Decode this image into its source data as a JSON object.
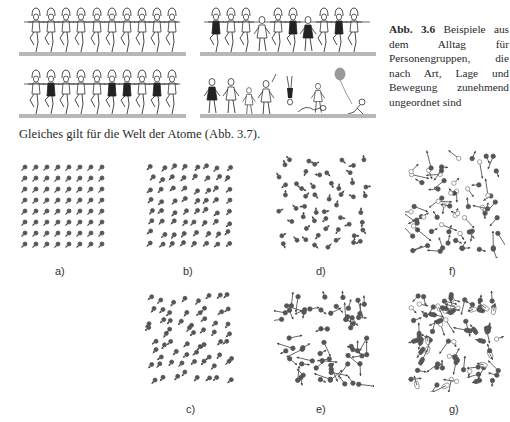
{
  "figure_3_6": {
    "caption_label": "Abb. 3.6",
    "caption_text": "Beispiele aus dem Alltag für Personengruppen, die nach Art, Lage und Bewegung zunehmend ungeordnet sind",
    "rows": [
      {
        "name": "top-left",
        "description": "10 identical dancers in a kick line"
      },
      {
        "name": "top-right",
        "description": "dancers in a kick line with some out of step"
      },
      {
        "name": "bottom-left",
        "description": "10 dancers in a kick line, some in dark dresses"
      },
      {
        "name": "bottom-right",
        "description": "people walking, jumping, lying, child with balloon"
      }
    ]
  },
  "body": {
    "sentence": "Gleiches gilt für die Welt der Atome (Abb. 3.7)."
  },
  "figure_3_7": {
    "panels": [
      {
        "id": "a",
        "label": "a)",
        "description": "perfect lattice, aligned molecules"
      },
      {
        "id": "b",
        "label": "b)",
        "description": "lattice with slight positional disorder"
      },
      {
        "id": "c",
        "label": "c)",
        "description": "lattice with more positional disorder"
      },
      {
        "id": "d",
        "label": "d)",
        "description": "orientational disorder"
      },
      {
        "id": "e",
        "label": "e)",
        "description": "random positions and motion arrows"
      },
      {
        "id": "f",
        "label": "f)",
        "description": "two species, random motion"
      },
      {
        "id": "g",
        "label": "g)",
        "description": "mixed species of different sizes, random motion"
      }
    ]
  },
  "colors": {
    "atom": "#555555",
    "atom_light": "#9a9a9a",
    "ground": "#b8b8b8",
    "text": "#2a2a2a"
  }
}
